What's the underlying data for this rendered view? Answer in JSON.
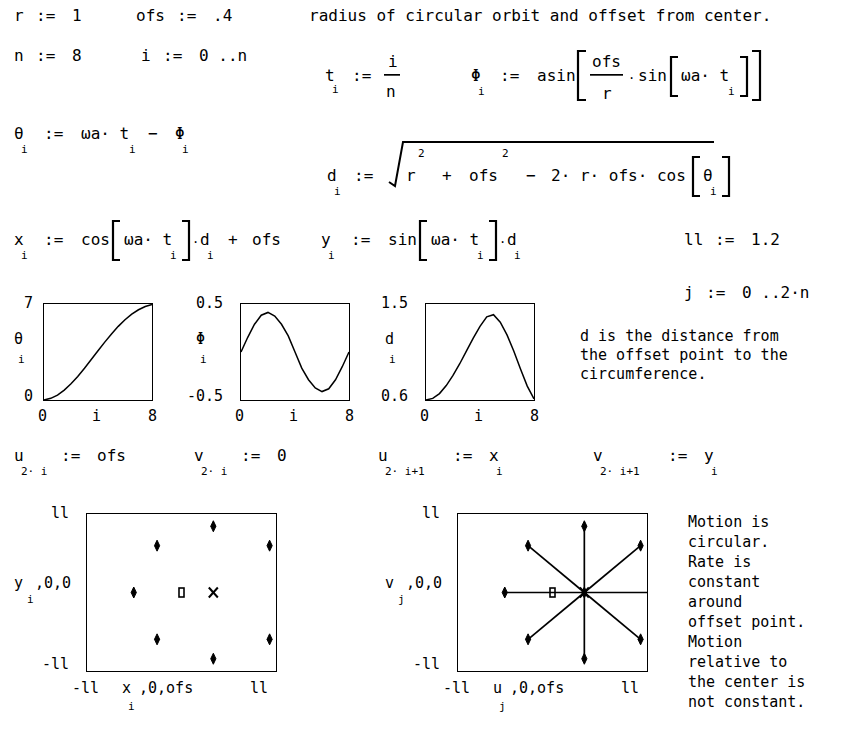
{
  "document": {
    "type": "mathcad-worksheet",
    "title": "Circular orbit viewed from an offset point"
  },
  "definitions": {
    "r": {
      "name": "r",
      "op": ":=",
      "value": "1"
    },
    "ofs": {
      "name": "ofs",
      "op": ":=",
      "value": ".4"
    },
    "n": {
      "name": "n",
      "op": ":=",
      "value": "8"
    },
    "i_range": {
      "name": "i",
      "op": ":=",
      "value": "0 ..n"
    },
    "j_range": {
      "name": "j",
      "op": ":=",
      "value": "0 ..2·n"
    },
    "ll": {
      "name": "ll",
      "op": ":=",
      "value": "1.2"
    }
  },
  "notes": {
    "header": "radius of circular orbit and offset from center.",
    "d_note": [
      "d is the distance from",
      "the offset point to the",
      "circumference."
    ],
    "motion_note": [
      "Motion is",
      "circular.",
      "Rate is",
      "constant",
      "around",
      "offset point.",
      "Motion",
      "relative to",
      "the center is",
      "not constant."
    ]
  },
  "equations": {
    "t": {
      "lhs": "t",
      "lhs_sub": "i",
      "op": ":=",
      "num": "i",
      "den": "n"
    },
    "phi": {
      "lhs": "Φ",
      "lhs_sub": "i",
      "op": ":=",
      "fn": "asin",
      "num": "ofs",
      "den": "r",
      "mul": "·",
      "inner_fn": "sin",
      "inner_arg": "ωa· t",
      "inner_sub": "i"
    },
    "theta": {
      "lhs": "θ",
      "lhs_sub": "i",
      "op": ":=",
      "rhs": "ωa· t",
      "rhs_sub": "i",
      "minus": "−",
      "term2": "Φ",
      "term2_sub": "i"
    },
    "d": {
      "lhs": "d",
      "lhs_sub": "i",
      "op": ":=",
      "term1": "r",
      "sup1": "2",
      "plus": "+",
      "term2": "ofs",
      "sup2": "2",
      "minus": "−",
      "term3": "2· r· ofs· cos",
      "arg": "θ",
      "arg_sub": "i"
    },
    "x": {
      "lhs": "x",
      "lhs_sub": "i",
      "op": ":=",
      "fn": "cos",
      "arg": "ωa· t",
      "arg_sub": "i",
      "mul": "·",
      "factor": "d",
      "factor_sub": "i",
      "plus": "+",
      "offset": "ofs"
    },
    "y": {
      "lhs": "y",
      "lhs_sub": "i",
      "op": ":=",
      "fn": "sin",
      "arg": "ωa· t",
      "arg_sub": "i",
      "mul": "·",
      "factor": "d",
      "factor_sub": "i"
    },
    "u_even": {
      "lhs": "u",
      "lhs_sub": "2· i",
      "op": ":=",
      "rhs": "ofs",
      "rhs_sub": ""
    },
    "v_even": {
      "lhs": "v",
      "lhs_sub": "2· i",
      "op": ":=",
      "rhs": "0",
      "rhs_sub": ""
    },
    "u_odd": {
      "lhs": "u",
      "lhs_sub": "2· i+1",
      "op": ":=",
      "rhs": "x",
      "rhs_sub": "i"
    },
    "v_odd": {
      "lhs": "v",
      "lhs_sub": "2· i+1",
      "op": ":=",
      "rhs": "y",
      "rhs_sub": "i"
    }
  },
  "chart_data": [
    {
      "id": "theta-plot",
      "type": "line",
      "ylabel": "θ",
      "ylabel_sub": "i",
      "xlabel": "i",
      "ylim": [
        0,
        7
      ],
      "xlim": [
        0,
        8
      ],
      "ytick_labels": [
        "0",
        "7"
      ],
      "xtick_labels": [
        "0",
        "8"
      ],
      "grid": false,
      "x": [
        0,
        0.5,
        1,
        1.5,
        2,
        2.5,
        3,
        3.5,
        4,
        4.5,
        5,
        5.5,
        6,
        6.5,
        7,
        7.5,
        8
      ],
      "values": [
        0.0,
        0.12,
        0.36,
        0.72,
        1.18,
        1.72,
        2.32,
        2.95,
        3.59,
        4.22,
        4.82,
        5.37,
        5.85,
        6.26,
        6.58,
        6.82,
        6.96
      ]
    },
    {
      "id": "phi-plot",
      "type": "line",
      "ylabel": "Φ",
      "ylabel_sub": "i",
      "xlabel": "i",
      "ylim": [
        -0.5,
        0.5
      ],
      "xlim": [
        0,
        8
      ],
      "ytick_labels": [
        "-0.5",
        "0.5"
      ],
      "xtick_labels": [
        "0",
        "8"
      ],
      "grid": false,
      "x": [
        0,
        0.5,
        1,
        1.5,
        2,
        2.5,
        3,
        3.5,
        4,
        4.5,
        5,
        5.5,
        6,
        6.5,
        7,
        7.5,
        8
      ],
      "values": [
        0.0,
        0.153,
        0.289,
        0.383,
        0.412,
        0.375,
        0.289,
        0.168,
        0.0,
        -0.168,
        -0.289,
        -0.375,
        -0.412,
        -0.383,
        -0.289,
        -0.153,
        0.0
      ]
    },
    {
      "id": "d-plot",
      "type": "line",
      "ylabel": "d",
      "ylabel_sub": "i",
      "xlabel": "i",
      "ylim": [
        0.6,
        1.5
      ],
      "xlim": [
        0,
        8
      ],
      "ytick_labels": [
        "0.6",
        "1.5"
      ],
      "xtick_labels": [
        "0",
        "8"
      ],
      "grid": false,
      "x": [
        0,
        0.5,
        1,
        1.5,
        2,
        2.5,
        3,
        3.5,
        4,
        4.5,
        5,
        5.5,
        6,
        6.5,
        7,
        7.5,
        8
      ],
      "values": [
        0.6,
        0.615,
        0.66,
        0.735,
        0.83,
        0.94,
        1.06,
        1.18,
        1.29,
        1.38,
        1.4,
        1.33,
        1.21,
        1.06,
        0.89,
        0.73,
        0.61
      ]
    },
    {
      "id": "xy-scatter",
      "type": "scatter",
      "ylabel": "y",
      "ylabel_sub": "i",
      "ylabel_extra": ",0,0",
      "xlabel": "x",
      "xlabel_sub": "i",
      "xlabel_extra": ",0,ofs",
      "ylim": [
        -1.2,
        1.2
      ],
      "xlim": [
        -1.2,
        1.2
      ],
      "ytick_labels": [
        "-ll",
        "ll"
      ],
      "xtick_labels": [
        "-ll",
        "ll"
      ],
      "grid": false,
      "series": [
        {
          "name": "orbit-points",
          "marker": "diamond",
          "points": [
            [
              1.4,
              0.0
            ],
            [
              1.107,
              0.707
            ],
            [
              0.4,
              1.0
            ],
            [
              -0.307,
              0.707
            ],
            [
              -0.6,
              0.0
            ],
            [
              -0.307,
              -0.707
            ],
            [
              0.4,
              -1.0
            ],
            [
              1.107,
              -0.707
            ],
            [
              1.4,
              0.0
            ]
          ]
        },
        {
          "name": "origin-marker",
          "marker": "square",
          "points": [
            [
              0.0,
              0.0
            ]
          ]
        },
        {
          "name": "offset-marker",
          "marker": "cross",
          "points": [
            [
              0.4,
              0.0
            ]
          ]
        }
      ]
    },
    {
      "id": "uv-star",
      "type": "line",
      "ylabel": "v",
      "ylabel_sub": "j",
      "ylabel_extra": ",0,0",
      "xlabel": "u",
      "xlabel_sub": "j",
      "xlabel_extra": ",0,ofs",
      "ylim": [
        -1.2,
        1.2
      ],
      "xlim": [
        -1.2,
        1.2
      ],
      "ytick_labels": [
        "-ll",
        "ll"
      ],
      "xtick_labels": [
        "-ll",
        "ll"
      ],
      "grid": false,
      "series": [
        {
          "name": "spokes",
          "marker": "diamond",
          "center": [
            0.4,
            0.0
          ],
          "points": [
            [
              1.4,
              0.0
            ],
            [
              1.107,
              0.707
            ],
            [
              0.4,
              1.0
            ],
            [
              -0.307,
              0.707
            ],
            [
              -0.6,
              0.0
            ],
            [
              -0.307,
              -0.707
            ],
            [
              0.4,
              -1.0
            ],
            [
              1.107,
              -0.707
            ]
          ]
        },
        {
          "name": "origin-marker",
          "marker": "square",
          "points": [
            [
              0.0,
              0.0
            ]
          ]
        },
        {
          "name": "offset-marker",
          "marker": "cross",
          "points": [
            [
              0.4,
              0.0
            ]
          ]
        }
      ]
    }
  ]
}
